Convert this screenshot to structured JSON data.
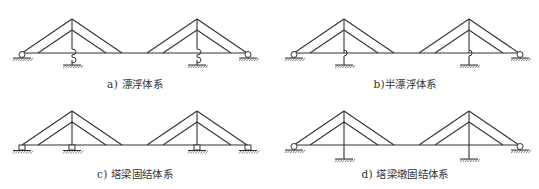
{
  "figure": {
    "panels": [
      {
        "id": "a",
        "caption": "a) 漂浮体系",
        "system": "floating",
        "tower_connection": "none",
        "tower_base": "fixed-to-ground-with-spring"
      },
      {
        "id": "b",
        "caption": "b)半漂浮体系",
        "system": "semi-floating",
        "tower_connection": "vertical-support",
        "tower_base": "fixed-to-ground"
      },
      {
        "id": "c",
        "caption": "c) 塔梁固结体系",
        "system": "tower-girder-consolidated",
        "tower_connection": "rigid",
        "tower_base": "hinged-support"
      },
      {
        "id": "d",
        "caption": "d) 塔梁墩固结体系",
        "system": "tower-girder-pier-consolidated",
        "tower_connection": "rigid",
        "tower_base": "fixed-to-ground"
      }
    ],
    "common": {
      "towers": 2,
      "cables_per_side": 2,
      "end_supports": "roller",
      "line_color": "#333333"
    }
  }
}
